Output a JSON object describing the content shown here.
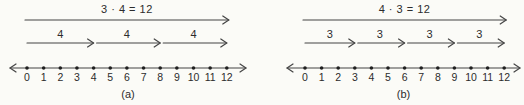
{
  "figure": {
    "background": "#fbfbf7",
    "line_color": "#454545",
    "dot_color": "#1f1f1f",
    "text_color": "#2c2c2c",
    "panels": [
      {
        "caption": "(a)",
        "equation": "3 · 4 = 12",
        "jumps": [
          {
            "label": "4",
            "from": 0,
            "to": 4
          },
          {
            "label": "4",
            "from": 4,
            "to": 8
          },
          {
            "label": "4",
            "from": 8,
            "to": 12
          }
        ],
        "number_line": {
          "start": 0,
          "end": 12,
          "ticks": [
            "0",
            "1",
            "2",
            "3",
            "4",
            "5",
            "6",
            "7",
            "8",
            "9",
            "10",
            "11",
            "12"
          ]
        }
      },
      {
        "caption": "(b)",
        "equation": "4 · 3 = 12",
        "jumps": [
          {
            "label": "3",
            "from": 0,
            "to": 3
          },
          {
            "label": "3",
            "from": 3,
            "to": 6
          },
          {
            "label": "3",
            "from": 6,
            "to": 9
          },
          {
            "label": "3",
            "from": 9,
            "to": 12
          }
        ],
        "number_line": {
          "start": 0,
          "end": 12,
          "ticks": [
            "0",
            "1",
            "2",
            "3",
            "4",
            "5",
            "6",
            "7",
            "8",
            "9",
            "10",
            "11",
            "12"
          ]
        }
      }
    ]
  }
}
